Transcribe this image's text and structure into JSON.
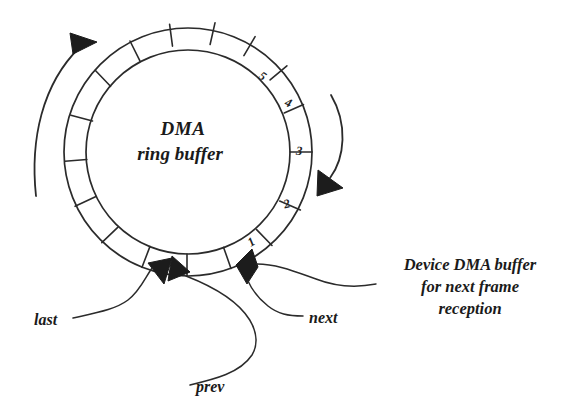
{
  "figure": {
    "title": "DMA ring buffer",
    "background_color": "#ffffff",
    "ink_color": "#2b2b2b",
    "fill_color": "#1c1c1c"
  },
  "ring": {
    "center_label_line1": "DMA",
    "center_label_line2": "ring buffer",
    "cell_count": 16,
    "numbered_cells": [
      {
        "label": "5",
        "x": 262,
        "y": 76
      },
      {
        "label": "4",
        "x": 289,
        "y": 103
      },
      {
        "label": "3",
        "x": 299,
        "y": 152
      },
      {
        "label": "2",
        "x": 287,
        "y": 204
      },
      {
        "label": "1",
        "x": 251,
        "y": 243
      }
    ]
  },
  "rotation_arrows": {
    "left_label": "counter-clockwise-rotation-arc",
    "right_label": "clockwise-rotation-arc"
  },
  "callouts": [
    {
      "id": "last",
      "label": "last",
      "x": 38,
      "y": 320
    },
    {
      "id": "prev",
      "label": "prev",
      "x": 200,
      "y": 393
    },
    {
      "id": "next",
      "label": "next",
      "x": 310,
      "y": 320
    }
  ],
  "device_buffer_note": {
    "line1": "Device DMA buffer",
    "line2": "for next frame",
    "line3": "reception"
  }
}
